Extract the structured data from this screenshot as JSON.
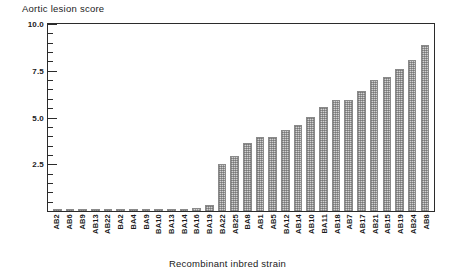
{
  "chart_data": {
    "type": "bar",
    "title": "",
    "ylabel": "Aortic lesion score",
    "xlabel": "Recombinant inbred strain",
    "ylim": [
      0,
      10.0
    ],
    "ytick_labels": [
      "10.0",
      "7.5",
      "5.0",
      "2.5"
    ],
    "ytick_values": [
      10.0,
      7.5,
      5.0,
      2.5
    ],
    "minor_tick_step": 0.5,
    "grid": false,
    "legend": null,
    "categories": [
      "AB2",
      "AB6",
      "AB9",
      "AB13",
      "AB22",
      "BA2",
      "BA4",
      "BA9",
      "BA10",
      "BA13",
      "BA14",
      "BA16",
      "BA19",
      "BA22",
      "AB25",
      "BA8",
      "AB1",
      "AB5",
      "BA12",
      "AB14",
      "AB10",
      "BA11",
      "AB18",
      "AB7",
      "AB17",
      "AB21",
      "AB15",
      "AB19",
      "AB24",
      "AB8"
    ],
    "values": [
      0.12,
      0.12,
      0.12,
      0.12,
      0.12,
      0.12,
      0.12,
      0.12,
      0.12,
      0.12,
      0.12,
      0.15,
      0.3,
      2.5,
      2.95,
      3.65,
      3.95,
      3.95,
      4.35,
      4.6,
      5.05,
      5.55,
      5.95,
      5.95,
      6.4,
      7.0,
      7.15,
      7.6,
      8.1,
      8.9
    ]
  },
  "colors": {
    "axis": "#2b2b2b",
    "bar_fill": "#d2d2d2",
    "bar_edge": "#8a8a8a",
    "text": "#1a1a1a",
    "background": "#ffffff"
  }
}
